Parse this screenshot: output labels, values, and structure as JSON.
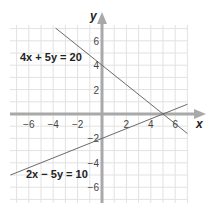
{
  "chart_data": {
    "type": "line",
    "title": "",
    "xlabel": "x",
    "ylabel": "y",
    "xlim": [
      -7.5,
      7.5
    ],
    "ylim": [
      -7.5,
      7.5
    ],
    "grid": true,
    "x_ticks": [
      -6,
      -4,
      -2,
      2,
      4,
      6
    ],
    "y_ticks": [
      6,
      4,
      2,
      -2,
      -4,
      -6
    ],
    "series": [
      {
        "name": "4x + 5y = 20",
        "equation": "4x + 5y = 20",
        "slope": -0.8,
        "intercept": 4,
        "x": [
          -3.8,
          7
        ],
        "y": [
          7.04,
          -1.6
        ]
      },
      {
        "name": "2x − 5y = 10",
        "equation": "2x − 5y = 10",
        "slope": 0.4,
        "intercept": -2,
        "x": [
          -7.5,
          7
        ],
        "y": [
          -5,
          0.8
        ]
      }
    ],
    "intersection": {
      "x": 5,
      "y": 0
    }
  },
  "labels": {
    "x_axis": "x",
    "y_axis": "y",
    "eq1": "4x + 5y = 20",
    "eq2": "2x − 5y = 10",
    "x_tick_labels": [
      "−6",
      "−4",
      "−2",
      "2",
      "4",
      "6"
    ],
    "y_tick_labels": [
      "6",
      "4",
      "2",
      "−2",
      "−4",
      "−6"
    ]
  },
  "colors": {
    "grid": "#e2e2e2",
    "axis": "#a9a9a9",
    "line": "#6a6a6a",
    "text": "#222222"
  }
}
